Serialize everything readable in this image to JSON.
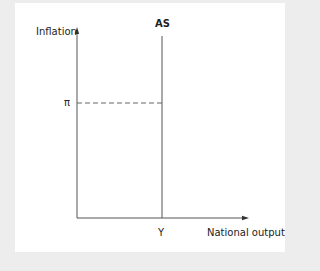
{
  "diagram": {
    "type": "aggregate-supply",
    "y_axis_label": "Inflation",
    "x_axis_label": "National output",
    "curve_label": "AS",
    "y_marker_label": "π",
    "x_marker_label": "Y",
    "colors": {
      "background": "#ededed",
      "panel": "#ffffff",
      "axis": "#555555",
      "curve": "#555555",
      "dashed": "#666666",
      "text": "#222222"
    }
  }
}
